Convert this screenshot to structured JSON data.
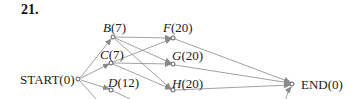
{
  "problem_number": "21.",
  "nodes": {
    "start": {
      "name": "START",
      "value": "(0)",
      "label": "START(0)"
    },
    "b": {
      "name": "B",
      "value": "(7)"
    },
    "c": {
      "name": "C",
      "value": "(7)"
    },
    "d": {
      "name": "D",
      "value": "(12)"
    },
    "f": {
      "name": "F",
      "value": "(20)"
    },
    "g": {
      "name": "G",
      "value": "(20)"
    },
    "h": {
      "name": "H",
      "value": "(20)"
    },
    "end": {
      "name": "END",
      "value": "(0)",
      "label": "END(0)"
    }
  },
  "edges": [
    [
      "START",
      "B"
    ],
    [
      "START",
      "C"
    ],
    [
      "START",
      "D"
    ],
    [
      "START",
      "(offscreen)"
    ],
    [
      "B",
      "F"
    ],
    [
      "B",
      "G"
    ],
    [
      "B",
      "H"
    ],
    [
      "C",
      "F"
    ],
    [
      "C",
      "G"
    ],
    [
      "C",
      "H"
    ],
    [
      "D",
      "(offscreen)"
    ],
    [
      "F",
      "END"
    ],
    [
      "G",
      "END"
    ],
    [
      "H",
      "END"
    ],
    [
      "(offscreen)",
      "END"
    ]
  ],
  "colors": {
    "edge": "#8a8a8a",
    "text": "#222222"
  }
}
